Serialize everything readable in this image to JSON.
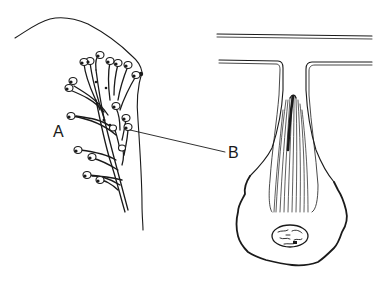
{
  "figure": {
    "labels": {
      "a": "A",
      "b": "B"
    },
    "panels": [
      {
        "id": "left",
        "description": "Branching glandular cluster within tissue outline, labeled A"
      },
      {
        "id": "right",
        "description": "Single gland cell with duct, striated fibrous interior, and nucleus, labeled B"
      }
    ],
    "colors": {
      "ink": "#1a1a1a",
      "background": "#ffffff"
    }
  }
}
